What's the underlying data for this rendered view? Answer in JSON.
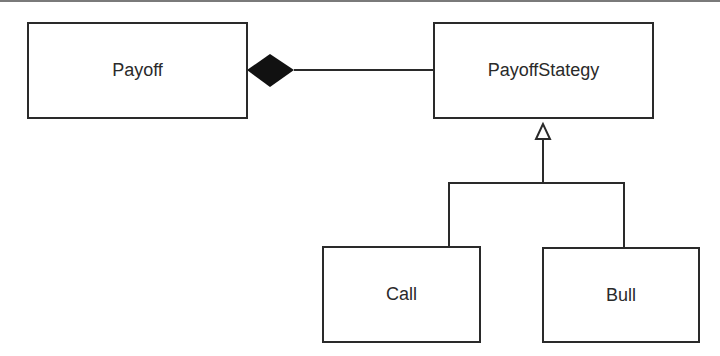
{
  "diagram": {
    "type": "UML class diagram",
    "classes": [
      {
        "id": "payoff",
        "label": "Payoff"
      },
      {
        "id": "payoff_strategy",
        "label": "PayoffStategy"
      },
      {
        "id": "call",
        "label": "Call"
      },
      {
        "id": "bull",
        "label": "Bull"
      }
    ],
    "relationships": [
      {
        "type": "composition",
        "from": "Payoff",
        "to": "PayoffStategy",
        "marker": "filled-diamond"
      },
      {
        "type": "inheritance",
        "from": "Call",
        "to": "PayoffStategy",
        "marker": "hollow-triangle"
      },
      {
        "type": "inheritance",
        "from": "Bull",
        "to": "PayoffStategy",
        "marker": "hollow-triangle"
      }
    ],
    "colors": {
      "line": "#2a2a2a",
      "background": "#ffffff",
      "text": "#2a2a2a"
    }
  }
}
